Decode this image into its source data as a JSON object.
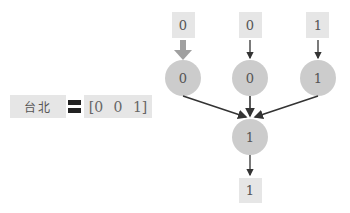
{
  "word": {
    "label": "台北",
    "equals_icon": "equals-sign-icon",
    "vector": "[0  0  1]"
  },
  "graph": {
    "inputs": [
      "0",
      "0",
      "1"
    ],
    "hidden": [
      "0",
      "0",
      "1"
    ],
    "sum_node": "1",
    "output": "1"
  },
  "colors": {
    "box": "#e6e6e6",
    "node": "#cccccc",
    "arrow": "#333333",
    "highlight_arrow": "#a0a0a0"
  }
}
